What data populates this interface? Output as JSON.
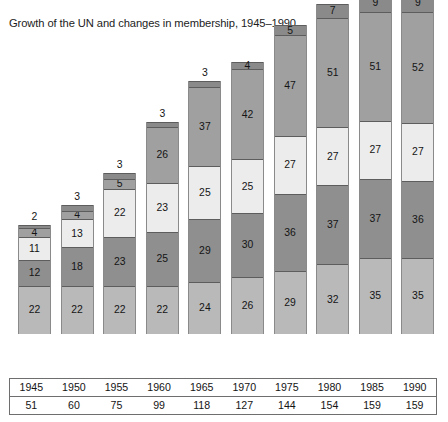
{
  "chart_data": {
    "type": "bar",
    "title": "Growth of the UN and changes in membership, 1945–1990",
    "xlabel": "",
    "ylabel": "",
    "stacked": true,
    "grid": false,
    "legend": "none",
    "categories": [
      "1945",
      "1950",
      "1955",
      "1960",
      "1965",
      "1970",
      "1975",
      "1980",
      "1985",
      "1990"
    ],
    "totals": [
      51,
      60,
      75,
      99,
      118,
      127,
      144,
      154,
      159,
      159
    ],
    "ylim": [
      0,
      168
    ],
    "series": [
      {
        "name": "segment-1",
        "color": "#b9b9b9",
        "values": [
          22,
          22,
          22,
          22,
          24,
          26,
          29,
          32,
          35,
          35
        ]
      },
      {
        "name": "segment-2",
        "color": "#8f8f8f",
        "values": [
          12,
          18,
          23,
          25,
          29,
          30,
          36,
          37,
          37,
          36
        ]
      },
      {
        "name": "segment-3",
        "color": "#ececec",
        "values": [
          11,
          13,
          22,
          23,
          25,
          25,
          27,
          27,
          27,
          27
        ]
      },
      {
        "name": "segment-4",
        "color": "#a0a0a0",
        "values": [
          4,
          4,
          5,
          26,
          37,
          42,
          47,
          51,
          51,
          52
        ]
      },
      {
        "name": "segment-5",
        "color": "#8a8a8a",
        "values": [
          2,
          3,
          3,
          3,
          3,
          4,
          5,
          7,
          9,
          9
        ]
      }
    ],
    "outside_label_flags": [
      [
        false,
        false,
        false,
        false,
        true
      ],
      [
        false,
        false,
        false,
        false,
        true
      ],
      [
        false,
        false,
        false,
        false,
        true
      ],
      [
        false,
        false,
        false,
        false,
        true
      ],
      [
        false,
        false,
        false,
        false,
        true
      ],
      [
        false,
        false,
        false,
        false,
        false
      ],
      [
        false,
        false,
        false,
        false,
        false
      ],
      [
        false,
        false,
        false,
        false,
        false
      ],
      [
        false,
        false,
        false,
        false,
        false
      ],
      [
        false,
        false,
        false,
        false,
        false
      ]
    ],
    "table": {
      "row_years_header": "",
      "row_totals_header": "",
      "years": [
        "1945",
        "1950",
        "1955",
        "1960",
        "1965",
        "1970",
        "1975",
        "1980",
        "1985",
        "1990"
      ],
      "totals": [
        "51",
        "60",
        "75",
        "99",
        "118",
        "127",
        "144",
        "154",
        "159",
        "159"
      ]
    }
  },
  "colors": {
    "segment_1": "#b9b9b9",
    "segment_2": "#8f8f8f",
    "segment_3": "#ececec",
    "segment_4": "#a0a0a0",
    "segment_5": "#8a8a8a",
    "text": "#141414",
    "border": "#6e6e6e",
    "background": "#ffffff"
  }
}
